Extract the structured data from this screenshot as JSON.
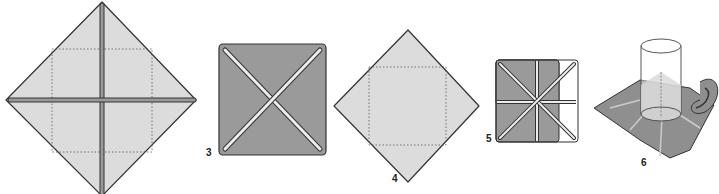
{
  "diagram": {
    "type": "folding-instructions",
    "colors": {
      "light_paper": "#dcdcdc",
      "dark_paper": "#9a9a9a",
      "outline": "#333333",
      "crease": "#ececec"
    },
    "steps": [
      {
        "label": "",
        "desc": "Diamond sheet with cross creases and dotted square"
      },
      {
        "label": "3",
        "desc": "Dark square with diagonal creases"
      },
      {
        "label": "4",
        "desc": "Diamond with dotted inner square"
      },
      {
        "label": "5",
        "desc": "Dark square with eight creases"
      },
      {
        "label": "6",
        "desc": "Folded filter with cylinder and hand"
      }
    ]
  }
}
